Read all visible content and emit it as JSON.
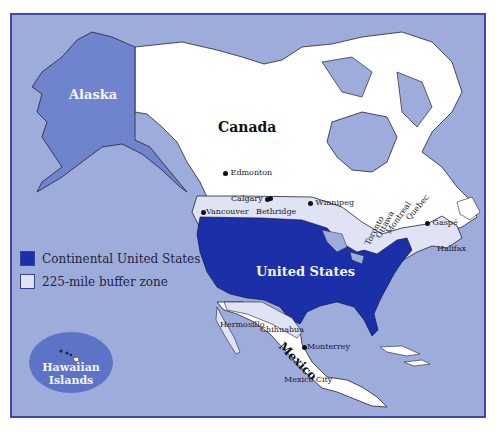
{
  "map": {
    "regions": {
      "alaska": "Alaska",
      "canada": "Canada",
      "united_states": "United States",
      "mexico": "Mexico",
      "hawaii_line1": "Hawaiian",
      "hawaii_line2": "Islands"
    },
    "cities": [
      {
        "name": "Edmonton"
      },
      {
        "name": "Calgary"
      },
      {
        "name": "Bethridge"
      },
      {
        "name": "Winnipeg"
      },
      {
        "name": "Vancouver"
      },
      {
        "name": "Toronto"
      },
      {
        "name": "Ottawa"
      },
      {
        "name": "Montreal"
      },
      {
        "name": "Quebec"
      },
      {
        "name": "Gaspé"
      },
      {
        "name": "Halifax"
      },
      {
        "name": "Hermosillo"
      },
      {
        "name": "Chihuahua"
      },
      {
        "name": "Monterrey"
      },
      {
        "name": "Mexico City"
      }
    ],
    "legend": [
      {
        "label": "Continental United States",
        "color": "#1a2fa8"
      },
      {
        "label": "225-mile buffer zone",
        "color": "#dfe3f3"
      }
    ],
    "colors": {
      "ocean": "#9eacdc",
      "alaska": "#6f84cc",
      "canada": "#ffffff",
      "us": "#1a2fa8",
      "buffer": "#dfe3f3",
      "frame": "#3a4cb0"
    }
  }
}
